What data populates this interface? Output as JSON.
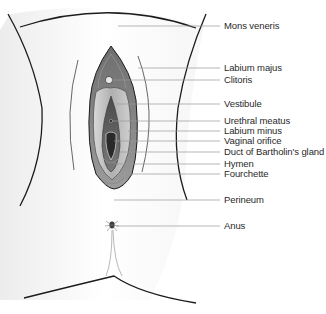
{
  "diagram": {
    "type": "anatomical-illustration",
    "colors": {
      "outline": "#1c1c1c",
      "leader_line": "#9a9a9a",
      "skin_shade": "#e6e6e6",
      "labium_majus_fill": "#7a7a7a",
      "labium_minus_fill": "#bdbdbd",
      "vestibule_fill": "#5a5a5a",
      "text": "#2a2a2a"
    },
    "labels": [
      {
        "text": "Mons veneris",
        "y": 26,
        "line_from_x": 118
      },
      {
        "text": "Labium majus",
        "y": 68,
        "line_from_x": 138
      },
      {
        "text": "Clitoris",
        "y": 80,
        "line_from_x": 112
      },
      {
        "text": "Vestibule",
        "y": 104,
        "line_from_x": 116
      },
      {
        "text": "Urethral meatus",
        "y": 121,
        "line_from_x": 112
      },
      {
        "text": "Labium minus",
        "y": 131,
        "line_from_x": 128
      },
      {
        "text": "Vaginal orifice",
        "y": 141,
        "line_from_x": 114
      },
      {
        "text": "Duct of Bartholin's gland",
        "y": 152,
        "line_from_x": 120
      },
      {
        "text": "Hymen",
        "y": 164,
        "line_from_x": 114
      },
      {
        "text": "Fourchette",
        "y": 174,
        "line_from_x": 118
      },
      {
        "text": "Perineum",
        "y": 200,
        "line_from_x": 114
      },
      {
        "text": "Anus",
        "y": 226,
        "line_from_x": 116
      }
    ]
  }
}
